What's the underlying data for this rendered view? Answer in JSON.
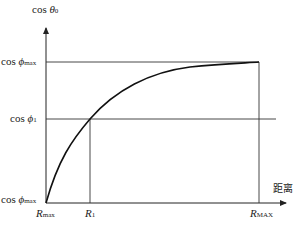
{
  "diagram": {
    "y_axis_label": {
      "prefix": "cos ",
      "symbol": "θ",
      "sub": "0"
    },
    "x_axis_label": "距离",
    "y_ticks": [
      {
        "prefix": "cos ",
        "symbol": "ϕ",
        "sub": "max",
        "position": "top"
      },
      {
        "prefix": "cos ",
        "symbol": "ϕ",
        "sub": "1",
        "position": "middle"
      },
      {
        "prefix": "cos ",
        "symbol": "ϕ",
        "sub": "max",
        "position": "origin"
      }
    ],
    "x_ticks": [
      {
        "symbol": "R",
        "sub": "max"
      },
      {
        "symbol": "R",
        "sub": "1"
      },
      {
        "symbol": "R",
        "sub": "MAX"
      }
    ],
    "colors": {
      "line": "#222222",
      "background": "#ffffff"
    }
  }
}
